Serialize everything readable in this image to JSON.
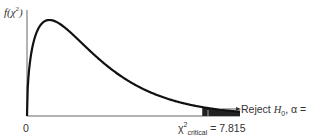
{
  "diagram": {
    "y_axis_label": {
      "func": "f(χ",
      "power": "2",
      "close": ")"
    },
    "origin_label": "0",
    "critical_label": {
      "symbol": "χ",
      "power": "2",
      "subscript": "critical",
      "value_text": " = 7.815"
    },
    "reject_label": {
      "prefix": "Reject ",
      "h": "H",
      "h_sub": "0",
      "suffix": ", α = 0.05"
    },
    "colors": {
      "curve": "#111111",
      "axis": "#555555",
      "shade": "#222222"
    }
  },
  "chart_data": {
    "type": "area",
    "title": "",
    "xlabel": "",
    "ylabel": "f(χ²)",
    "distribution": "chi-square",
    "degrees_of_freedom": 3,
    "alpha": 0.05,
    "critical_value": 7.815,
    "xlim": [
      0,
      9.5
    ],
    "annotations": [
      "Reject H0, α = 0.05",
      "χ²critical = 7.815",
      "0"
    ]
  }
}
